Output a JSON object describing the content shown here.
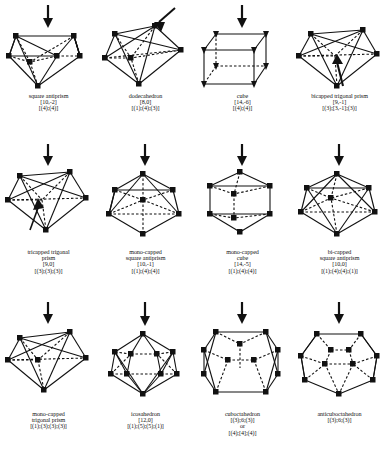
{
  "figure": {
    "ink_color": "#111111",
    "background": "#ffffff"
  },
  "polyhedra": [
    {
      "id": "square-antiprism",
      "name_lines": [
        "square antiprism"
      ],
      "code": "[10,-2]",
      "decomposition": [
        "[(4);(4)]"
      ],
      "arrow": "down",
      "marker": "square",
      "row": 1,
      "col": 1
    },
    {
      "id": "dodecahedron",
      "name_lines": [
        "dodecahedron"
      ],
      "code": "[8,0]",
      "decomposition": [
        "[(1);(4);(3)]"
      ],
      "arrow": "diagonal",
      "marker": "square",
      "row": 1,
      "col": 2
    },
    {
      "id": "cube",
      "name_lines": [
        "cube"
      ],
      "code": "[14,-6]",
      "decomposition": [
        "[(4);(4)]"
      ],
      "arrow": "down",
      "marker": "triangle",
      "row": 1,
      "col": 3
    },
    {
      "id": "bicapped-trigonal-prism",
      "name_lines": [
        "bicapped trigonal prism"
      ],
      "code": "[9,-1]",
      "decomposition": [
        "[(3);[3,-1];(3)]"
      ],
      "arrow": "up-inner",
      "marker": "square",
      "row": 1,
      "col": 4
    },
    {
      "id": "tricapped-trigonal-prism",
      "name_lines": [
        "tricapped trigonal",
        "prism"
      ],
      "code": "[9,0]",
      "decomposition": [
        "[(3);(3);(3)]"
      ],
      "arrow": "down",
      "marker": "square",
      "row": 2,
      "col": 1
    },
    {
      "id": "mono-capped-square-antiprism",
      "name_lines": [
        "mono-capped",
        "square antiprism"
      ],
      "code": "[10,-1]",
      "decomposition": [
        "[(1);(4);(4)]"
      ],
      "arrow": "down",
      "marker": "square",
      "row": 2,
      "col": 2
    },
    {
      "id": "mono-capped-cube",
      "name_lines": [
        "mono-capped",
        "cube"
      ],
      "code": "[14,-5]",
      "decomposition": [
        "[(1);(4);(4)]"
      ],
      "arrow": "down",
      "marker": "square",
      "row": 2,
      "col": 3
    },
    {
      "id": "bi-capped-square-antiprism",
      "name_lines": [
        "bi-capped",
        "square antiprism"
      ],
      "code": "[10,0]",
      "decomposition": [
        "[(1);(4);(4);(1)]"
      ],
      "arrow": "down",
      "marker": "square",
      "row": 2,
      "col": 4
    },
    {
      "id": "mono-capped-trigonal-prism",
      "name_lines": [
        "mono-capped",
        "trigonal prism"
      ],
      "code": "",
      "decomposition": [
        "[(1);(3);(3);(3)]"
      ],
      "arrow": "down",
      "marker": "square",
      "row": 3,
      "col": 1
    },
    {
      "id": "icosahedron",
      "name_lines": [
        "icosahedron"
      ],
      "code": "[12,0]",
      "decomposition": [
        "[(1);(5);(5);(1)]"
      ],
      "arrow": "down",
      "marker": "square",
      "row": 3,
      "col": 2
    },
    {
      "id": "cuboctahedron",
      "name_lines": [
        "cuboctahedron"
      ],
      "code": "[(3);6;(3)]",
      "decomposition": [
        "or",
        "[(4);[4];(4)]"
      ],
      "arrow": "down",
      "marker": "square",
      "row": 3,
      "col": 3
    },
    {
      "id": "anticuboctahedron",
      "name_lines": [
        "anticuboctahedron"
      ],
      "code": "[(3);6;(3)]",
      "decomposition": [],
      "arrow": "down",
      "marker": "square",
      "row": 3,
      "col": 4
    }
  ]
}
